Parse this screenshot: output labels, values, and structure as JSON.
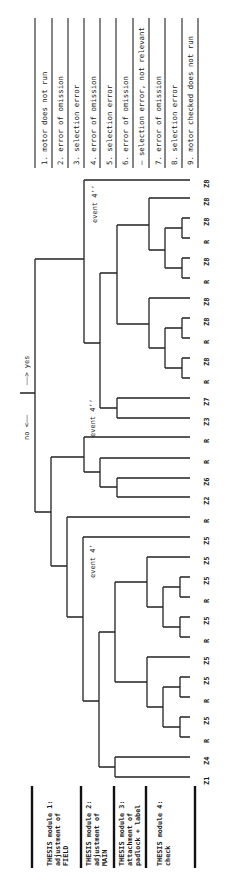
{
  "direction_label": {
    "no": "no <——",
    "yes": "——> yes"
  },
  "events": [
    {
      "id": "event-4-prime",
      "label": "event 4’"
    },
    {
      "id": "event-4-double-prime",
      "label": "event 4’’"
    },
    {
      "id": "event-4-triple-prime",
      "label": "event 4’’"
    }
  ],
  "legend": {
    "outcomes": [
      {
        "label": "1. motor does not run"
      },
      {
        "label": "2. error of omission"
      },
      {
        "label": "3. selection error"
      },
      {
        "label": "4. error of omission"
      },
      {
        "label": "5. selection error"
      },
      {
        "label": "6. error of omission"
      },
      {
        "label": "– selection error, not relevant"
      },
      {
        "label": "7. error of omission"
      },
      {
        "label": "8. selection error"
      },
      {
        "label": "9. motor checked does not run"
      }
    ],
    "modules": [
      {
        "lines": [
          "THESIS module 1:",
          "adjustment of",
          "FIELD"
        ]
      },
      {
        "lines": [
          "THESIS module 2:",
          "adjustment of",
          "MAIN"
        ]
      },
      {
        "lines": [
          "THESIS module 3:",
          "attachment of",
          "padlock + label"
        ]
      },
      {
        "lines": [
          "THESIS module 4:",
          "check"
        ]
      }
    ]
  },
  "leaves": [
    "Z8",
    "Z8",
    "Z8",
    "R",
    "Z8",
    "R",
    "Z8",
    "Z8",
    "R",
    "Z8",
    "R",
    "Z8",
    "R",
    "Z7",
    "Z3",
    "R",
    "R",
    "Z6",
    "Z2",
    "R",
    "Z5",
    "Z5",
    "Z5",
    "R",
    "Z5",
    "R",
    "Z5",
    "Z5",
    "R",
    "Z5",
    "R",
    "Z4",
    "Z1"
  ],
  "colors": {
    "ink": "#1a1a1a",
    "paper": "#ffffff"
  }
}
